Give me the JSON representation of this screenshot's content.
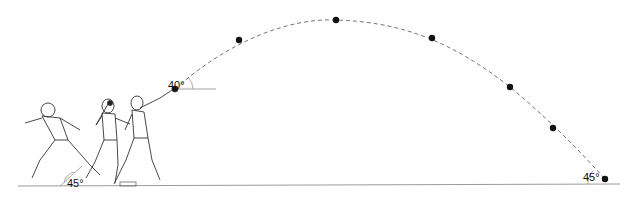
{
  "diagram": {
    "angles": {
      "release_angle": "40°",
      "landing_angle": "45°",
      "foot_angle": "45°"
    },
    "trajectory_points": [
      {
        "x": 175,
        "y": 89
      },
      {
        "x": 239,
        "y": 40
      },
      {
        "x": 336,
        "y": 20
      },
      {
        "x": 432,
        "y": 38
      },
      {
        "x": 510,
        "y": 87
      },
      {
        "x": 553,
        "y": 128
      },
      {
        "x": 605,
        "y": 179
      }
    ],
    "figures_count": 3,
    "colors": {
      "line": "#555555",
      "dots": "#111111",
      "ground": "#888888"
    }
  }
}
